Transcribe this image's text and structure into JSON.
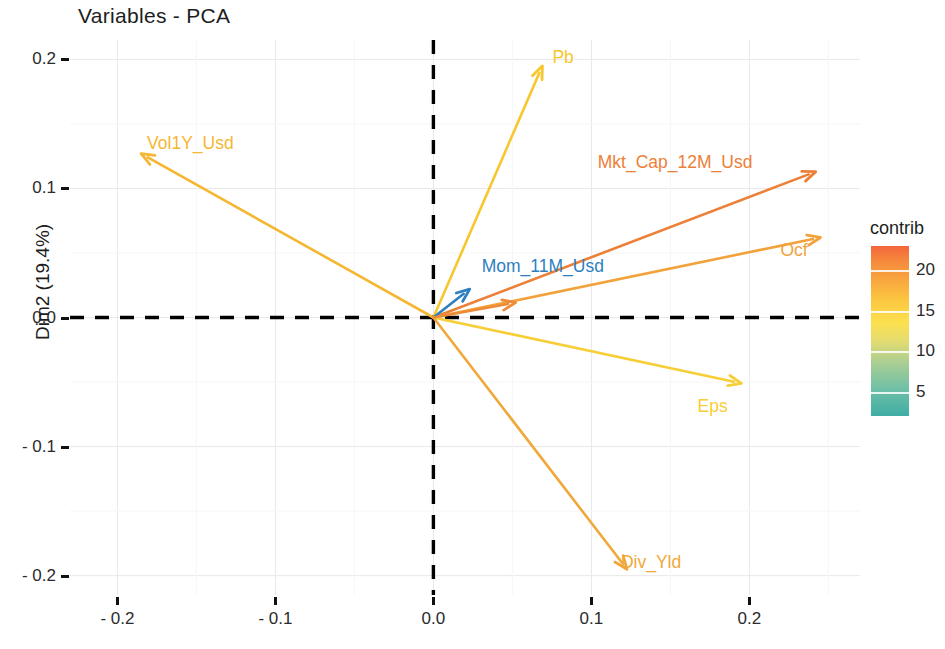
{
  "chart_data": {
    "type": "scatter",
    "subtype": "pca-variable-correlation-plot",
    "title": "Variables - PCA",
    "xlabel": "Dim1 (35.7%)",
    "ylabel": "Dim2 (19.4%)",
    "xlim": [
      -0.23,
      0.27
    ],
    "ylim": [
      -0.215,
      0.215
    ],
    "xticks": [
      -0.2,
      -0.1,
      0.0,
      0.1,
      0.2
    ],
    "xticklabels": [
      "- 0.2",
      "- 0.1",
      "0.0",
      "0.1",
      "0.2"
    ],
    "yticks": [
      -0.2,
      -0.1,
      0.0,
      0.1,
      0.2
    ],
    "yticklabels": [
      "- 0.2",
      "- 0.1",
      "0.0",
      "0.1",
      "0.2"
    ],
    "grid": true,
    "origin_lines": "dashed-black-at-zero",
    "legend": {
      "title": "contrib",
      "position": "right",
      "type": "continuous-colorbar",
      "ticks": [
        20,
        15,
        10,
        5
      ],
      "tick_labels": [
        "20",
        "15",
        "10",
        "5"
      ],
      "range": [
        2,
        23
      ],
      "gradient": [
        "#F4663C",
        "#F58A3C",
        "#F9A63E",
        "#FBC740",
        "#FCE04E",
        "#E3DC70",
        "#A9CE94",
        "#6FC0A6",
        "#3FADA4"
      ]
    },
    "variables": [
      {
        "name": "Vol1Y_Usd",
        "x": -0.185,
        "y": 0.127,
        "contrib": 12.5,
        "color": "#F5B731",
        "label_dx": 6,
        "label_dy": -10,
        "label_anchor": "start"
      },
      {
        "name": "Pb",
        "x": 0.069,
        "y": 0.195,
        "contrib": 11.0,
        "color": "#F7C72E",
        "label_dx": 10,
        "label_dy": -8,
        "label_anchor": "start"
      },
      {
        "name": "Mkt_Cap_12M_Usd",
        "x": 0.242,
        "y": 0.113,
        "contrib": 19.5,
        "color": "#ED8037",
        "label_dx": -218,
        "label_dy": -9,
        "label_anchor": "start"
      },
      {
        "name": "Ocf",
        "x": 0.245,
        "y": 0.062,
        "contrib": 15.5,
        "color": "#F2A23B",
        "label_dx": -40,
        "label_dy": 14,
        "label_anchor": "start"
      },
      {
        "name": "Mom_11M_Usd",
        "x": 0.023,
        "y": 0.022,
        "contrib": 2.5,
        "color": "#2E7FBF",
        "label_dx": 12,
        "label_dy": -22,
        "label_anchor": "start"
      },
      {
        "name": "Eps",
        "x": 0.195,
        "y": -0.051,
        "contrib": 10.5,
        "color": "#F8CE37",
        "label_dx": -44,
        "label_dy": 24,
        "label_anchor": "start"
      },
      {
        "name": "Div_Yld",
        "x": 0.1225,
        "y": -0.195,
        "contrib": 14.5,
        "color": "#F0A83A",
        "label_dx": -6,
        "label_dy": -6,
        "label_anchor": "start"
      },
      {
        "name": "",
        "x": 0.052,
        "y": 0.0115,
        "contrib": 17.0,
        "color": "#EE8B38",
        "label_dx": 0,
        "label_dy": 0,
        "label_anchor": "start"
      }
    ]
  },
  "plot": {
    "title": "Variables  -  PCA",
    "x_axis_title": "Dim1 (35.7%)",
    "y_axis_title": "Dim2 (19.4%)",
    "x_tick_labels": [
      "- 0.2",
      "- 0.1",
      "0.0",
      "0.1",
      "0.2"
    ],
    "y_tick_labels": [
      "0.2",
      "0.1",
      "0.0",
      "- 0.1",
      "- 0.2"
    ]
  },
  "legend": {
    "title": "contrib",
    "tick_labels": [
      "20",
      "15",
      "10",
      "5"
    ]
  }
}
